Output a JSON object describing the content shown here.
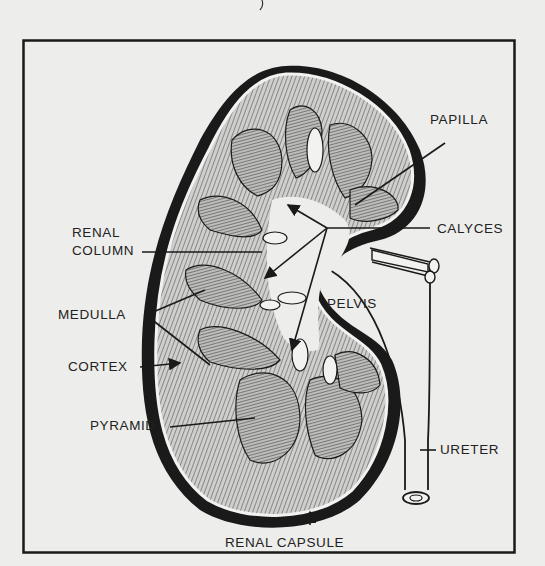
{
  "diagram": {
    "frame": {
      "x": 23,
      "y": 40,
      "width": 492,
      "height": 513,
      "stroke": "#1a1a1a"
    },
    "colors": {
      "background": "#ededeb",
      "ink": "#1a1a1a",
      "label_text": "#222222",
      "capsule": "#111111",
      "tissue_fill": "#9a9a98"
    },
    "labels": {
      "papilla": "PAPILLA",
      "calyces": "CALYCES",
      "renal_column_line1": "RENAL",
      "renal_column_line2": "COLUMN",
      "medulla": "MEDULLA",
      "cortex": "CORTEX",
      "pyramid": "PYRAMID",
      "pelvis": "PELVIS",
      "ureter": "URETER",
      "renal_capsule": "RENAL CAPSULE"
    }
  }
}
